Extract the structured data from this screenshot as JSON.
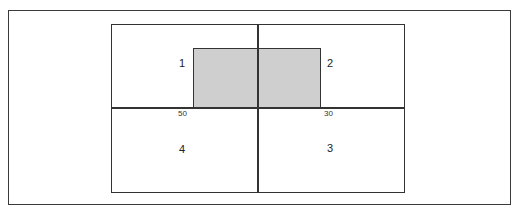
{
  "diagram": {
    "quadrants": [
      {
        "id": "q1",
        "label": "1"
      },
      {
        "id": "q2",
        "label": "2"
      },
      {
        "id": "q3",
        "label": "3"
      },
      {
        "id": "q4",
        "label": "4"
      }
    ],
    "edge_labels": {
      "left": "50",
      "right": "30"
    },
    "colors": {
      "line": "#333333",
      "shaded_fill": "#cfcfcf",
      "background": "#ffffff"
    }
  }
}
